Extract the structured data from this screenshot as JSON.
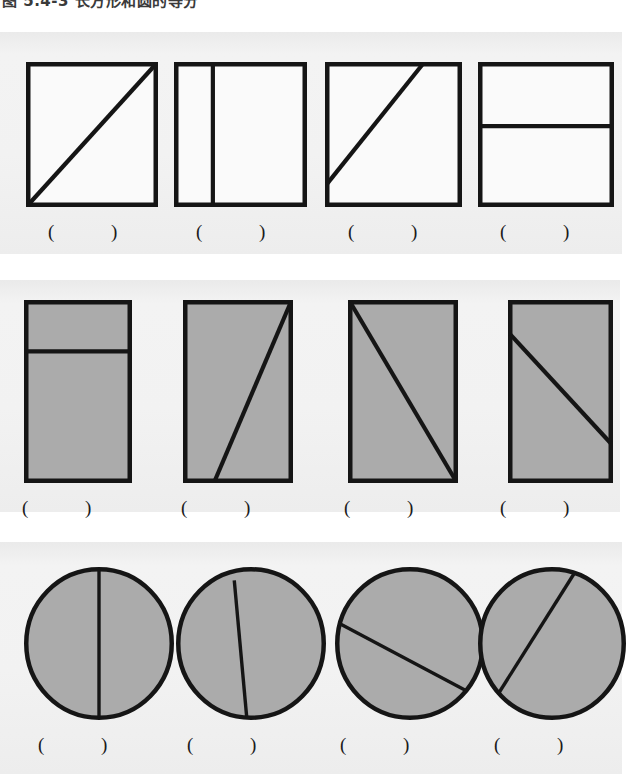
{
  "heading": {
    "text": "图 5.4-3  长方形和圆的等分"
  },
  "colors": {
    "ink": "#151515",
    "fill_gray": "#ababab",
    "paper": "#f1f1f1",
    "unfilled": "#fafafa"
  },
  "blank_label": "(        )",
  "rows": [
    {
      "id": "row-rectangles-unfilled",
      "shape": "rectangle",
      "filled": false,
      "figures": [
        {
          "id": "r1c1",
          "name": "square-with-diagonal-bottom-left-to-top-right",
          "x": 26,
          "y": 30,
          "w": 132,
          "h": 145,
          "lines": [
            {
              "type": "line",
              "x1": 0.0,
              "y1": 1.0,
              "x2": 1.0,
              "y2": 0.0
            }
          ],
          "blank_x": 48
        },
        {
          "id": "r1c2",
          "name": "square-with-vertical-line-at-one-quarter",
          "x": 174,
          "y": 30,
          "w": 133,
          "h": 145,
          "lines": [
            {
              "type": "line",
              "x1": 0.285,
              "y1": 0.0,
              "x2": 0.285,
              "y2": 1.0
            }
          ],
          "blank_x": 196
        },
        {
          "id": "r1c3",
          "name": "square-with-offset-diagonal",
          "x": 325,
          "y": 30,
          "w": 137,
          "h": 145,
          "lines": [
            {
              "type": "line",
              "x1": 0.0,
              "y1": 0.85,
              "x2": 0.72,
              "y2": 0.0
            }
          ],
          "blank_x": 348
        },
        {
          "id": "r1c4",
          "name": "rectangle-with-horizontal-line-upper",
          "x": 478,
          "y": 30,
          "w": 136,
          "h": 145,
          "lines": [
            {
              "type": "line",
              "x1": 0.0,
              "y1": 0.44,
              "x2": 1.0,
              "y2": 0.44
            }
          ],
          "blank_x": 500
        }
      ]
    },
    {
      "id": "row-rectangles-shaded",
      "shape": "rectangle",
      "filled": true,
      "figures": [
        {
          "id": "r2c1",
          "name": "shaded-rectangle-with-horizontal-line-near-top",
          "x": 24,
          "y": 20,
          "w": 108,
          "h": 183,
          "lines": [
            {
              "type": "line",
              "x1": 0.0,
              "y1": 0.275,
              "x2": 1.0,
              "y2": 0.275
            }
          ],
          "blank_x": 22
        },
        {
          "id": "r2c2",
          "name": "shaded-rectangle-with-diagonal-to-top-right-corner",
          "x": 183,
          "y": 20,
          "w": 110,
          "h": 183,
          "lines": [
            {
              "type": "line",
              "x1": 0.28,
              "y1": 1.0,
              "x2": 1.0,
              "y2": 0.0
            }
          ],
          "blank_x": 181
        },
        {
          "id": "r2c3",
          "name": "shaded-rectangle-with-corner-to-corner-diagonal",
          "x": 348,
          "y": 20,
          "w": 110,
          "h": 183,
          "lines": [
            {
              "type": "line",
              "x1": 0.0,
              "y1": 0.0,
              "x2": 1.0,
              "y2": 1.0
            }
          ],
          "blank_x": 344
        },
        {
          "id": "r2c4",
          "name": "shaded-rectangle-with-offset-diagonal",
          "x": 508,
          "y": 20,
          "w": 105,
          "h": 183,
          "lines": [
            {
              "type": "line",
              "x1": 0.0,
              "y1": 0.18,
              "x2": 1.0,
              "y2": 0.79
            }
          ],
          "blank_x": 500
        }
      ]
    },
    {
      "id": "row-circles-shaded",
      "shape": "circle",
      "filled": true,
      "figures": [
        {
          "id": "r3c1",
          "name": "shaded-circle-with-vertical-diameter",
          "x": 24,
          "y": 25,
          "w": 150,
          "h": 153,
          "lines": [
            {
              "type": "line",
              "x1": 0.5,
              "y1": 0.0,
              "x2": 0.5,
              "y2": 1.0
            }
          ],
          "blank_x": 38
        },
        {
          "id": "r3c2",
          "name": "shaded-circle-with-near-vertical-chord",
          "x": 176,
          "y": 25,
          "w": 150,
          "h": 153,
          "lines": [
            {
              "type": "line",
              "x1": 0.385,
              "y1": 0.075,
              "x2": 0.47,
              "y2": 0.99
            }
          ],
          "blank_x": 187
        },
        {
          "id": "r3c3",
          "name": "shaded-circle-with-descending-chord",
          "x": 335,
          "y": 25,
          "w": 150,
          "h": 153,
          "lines": [
            {
              "type": "line",
              "x1": 0.025,
              "y1": 0.37,
              "x2": 0.89,
              "y2": 0.82
            }
          ],
          "blank_x": 340
        },
        {
          "id": "r3c4",
          "name": "shaded-circle-with-ascending-chord",
          "x": 478,
          "y": 25,
          "w": 148,
          "h": 153,
          "lines": [
            {
              "type": "line",
              "x1": 0.125,
              "y1": 0.84,
              "x2": 0.66,
              "y2": 0.02
            }
          ],
          "blank_x": 494
        }
      ]
    }
  ]
}
